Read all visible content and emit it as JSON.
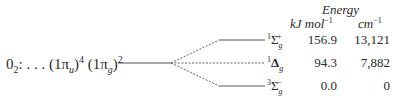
{
  "configuration": {
    "molecule": "0",
    "molecule_sub": "2",
    "ellipsis": ": . . . ",
    "orbital1": "(1π",
    "orbital1_sub": "u",
    "orbital1_close": ")",
    "orbital1_sup": "4",
    "orbital2": " (1π",
    "orbital2_sub": "g",
    "orbital2_close": ")",
    "orbital2_sup": "2"
  },
  "header": {
    "title": "Energy",
    "col1": "kJ mol",
    "col1_sup": "−1",
    "col2": "cm",
    "col2_sup": "−1"
  },
  "states": [
    {
      "mult": "1",
      "symbol": "Σ",
      "sub": "g",
      "sign": "+",
      "kj": "156.9",
      "cm": "13,121"
    },
    {
      "mult": "1",
      "symbol": "Δ",
      "sub": "g",
      "sign": "",
      "kj": "94.3",
      "cm": "7,882"
    },
    {
      "mult": "3",
      "symbol": "Σ",
      "sub": "g",
      "sign": "−",
      "kj": "0.0",
      "cm": "0"
    }
  ],
  "colors": {
    "line": "#555555",
    "text": "#2a2a2a"
  }
}
